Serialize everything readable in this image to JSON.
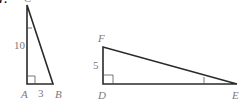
{
  "problem": {
    "number": "7."
  },
  "triangle_left": {
    "vertices": {
      "top": "C",
      "right_angle": "A",
      "bottom_right": "B"
    },
    "sides": {
      "AC": "10",
      "AB": "3"
    }
  },
  "triangle_right": {
    "vertices": {
      "top": "F",
      "right_angle": "D",
      "right": "E"
    },
    "sides": {
      "DF": "5"
    }
  },
  "colors": {
    "edge": "#2a2a2a",
    "label": "#7a7a7a"
  }
}
